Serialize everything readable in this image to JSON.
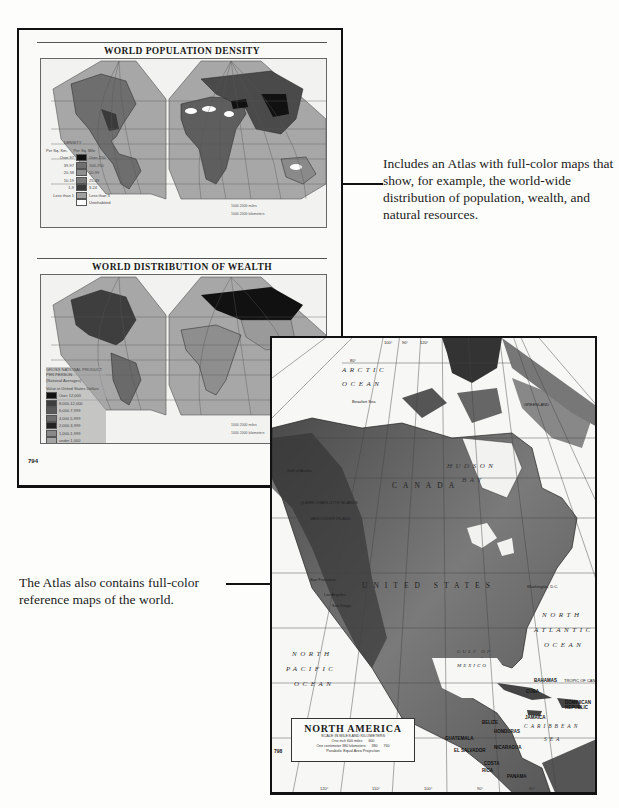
{
  "atlas_page": {
    "page_number": "794",
    "population_map": {
      "title": "WORLD POPULATION DENSITY",
      "legend_title": "DENSITY",
      "legend_headers": [
        "Per Sq. Km.",
        "Per Sq. Mile"
      ],
      "legend_rows": [
        {
          "km": "Over 97",
          "mile": "Over 250",
          "color": "#111111"
        },
        {
          "km": "39-97",
          "mile": "100-250",
          "color": "#6f6f6f"
        },
        {
          "km": "20-38",
          "mile": "50-99",
          "color": "#8e8e8e"
        },
        {
          "km": "10-19",
          "mile": "25-49",
          "color": "#7a7a7a"
        },
        {
          "km": "1-9",
          "mile": "3-24",
          "color": "#3a3a3a"
        },
        {
          "km": "Less than 1",
          "mile": "Less than 3",
          "color": "#a0a0a0"
        },
        {
          "km": "",
          "mile": "Uninhabited",
          "color": "#ffffff"
        }
      ],
      "scale_miles": "1000   2000 miles",
      "scale_km": "1000 2000 kilometers"
    },
    "wealth_map": {
      "title": "WORLD DISTRIBUTION OF WEALTH",
      "legend_title": "GROSS NATIONAL PRODUCT PER PERSON",
      "legend_subtitle": "(National Averages)",
      "legend_unit": "Value in United States Dollars",
      "legend_rows": [
        {
          "label": "Over 12,000",
          "color": "#111111"
        },
        {
          "label": "8,000-12,000",
          "color": "#3e3e3e"
        },
        {
          "label": "6,000-7,999",
          "color": "#5a5a5a"
        },
        {
          "label": "4,000-5,999",
          "color": "#6e6e6e"
        },
        {
          "label": "2,000-3,999",
          "color": "#222222"
        },
        {
          "label": "1,000-1,999",
          "color": "#888888"
        },
        {
          "label": "under 1,000",
          "color": "#a4a4a4"
        }
      ],
      "scale_miles": "1000   2000 miles",
      "scale_km": "1000 2000 kilometers"
    }
  },
  "captions": {
    "atlas_description": "Includes an Atlas with full-color maps that show, for example, the world-wide distribution of population, wealth, and natural resources.",
    "reference_maps": "The Atlas also contains full-color reference maps of the world."
  },
  "north_america_page": {
    "page_number": "798",
    "title": "NORTH AMERICA",
    "scale_heading": "SCALE IN MILES AND KILOMETERS",
    "scale_line1": "One inch 600 miles",
    "scale_line2": "One centimeter 380 kilometers",
    "scale_values": [
      "600",
      "380",
      "760"
    ],
    "projection": "Parabolic Equal Area Projection",
    "oceans": {
      "arctic_1": "ARCTIC",
      "arctic_2": "OCEAN",
      "pacific_1": "NORTH",
      "pacific_2": "PACIFIC",
      "pacific_3": "OCEAN",
      "atlantic_1": "NORTH",
      "atlantic_2": "ATLANTIC",
      "atlantic_3": "OCEAN",
      "gulf_1": "GULF OF",
      "gulf_2": "MEXICO",
      "caribbean_1": "CARIBBEAN",
      "caribbean_2": "SEA",
      "hudson_1": "HUDSON",
      "hudson_2": "BAY"
    },
    "regions": {
      "canada": "CANADA",
      "united_states": "UNITED STATES"
    },
    "places": {
      "greenland": "GREENLAND",
      "san_francisco": "San Francisco",
      "los_angeles": "Los Angeles",
      "san_diego": "San Diego",
      "washington": "Washington, D.C.",
      "bahamas": "BAHAMAS",
      "tropic": "TROPIC OF CANCER",
      "cuba": "CUBA",
      "jamaica": "JAMAICA",
      "dominican": "DOMINICAN REPUBLIC",
      "belize": "BELIZE",
      "honduras": "HONDURAS",
      "guatemala": "GUATEMALA",
      "el_salvador": "EL SALVADOR",
      "nicaragua": "NICARAGUA",
      "costa_rica_1": "COSTA",
      "costa_rica_2": "RICA",
      "panama": "PANAMA",
      "beaufort": "Beaufort Sea",
      "queen_charlotte": "QUEEN CHARLOTTE ISLANDS",
      "vancouver": "VANCOUVER ISLAND",
      "gulf_alaska": "Gulf of Alaska"
    },
    "longitudes": [
      "120°",
      "110°",
      "100°",
      "90°",
      "80°"
    ],
    "top_latitudes": [
      "80°",
      "100°",
      "90°",
      "120°"
    ]
  }
}
